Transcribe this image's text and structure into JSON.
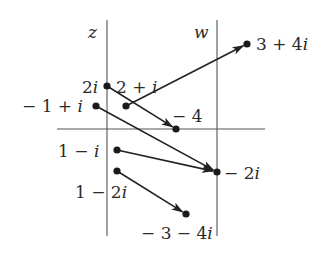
{
  "figure": {
    "axes": {
      "z_label": "z",
      "w_label": "w",
      "z_axis_x": 107,
      "w_axis_x": 217,
      "real_axis_y": 129,
      "real_axis_x1": 57,
      "real_axis_x2": 265,
      "vertical_top": 20,
      "vertical_bottom": 236
    },
    "colors": {
      "axis": "#555555",
      "arrow": "#222222",
      "point": "#1a1a1a",
      "text": "#2a2a2a"
    },
    "points": [
      {
        "id": "z-2i",
        "label": "2i",
        "x": 107,
        "y": 86,
        "lx": 82,
        "ly": 93,
        "anchor": "start"
      },
      {
        "id": "z-2+i",
        "label": "2 + i",
        "x": 126,
        "y": 106,
        "lx": 116,
        "ly": 93,
        "anchor": "start"
      },
      {
        "id": "z--1+i",
        "label": "− 1 + i",
        "x": 96,
        "y": 106,
        "lx": 22,
        "ly": 112,
        "anchor": "start"
      },
      {
        "id": "z-1-i",
        "label": "1 − i",
        "x": 117,
        "y": 150,
        "lx": 58,
        "ly": 157,
        "anchor": "start"
      },
      {
        "id": "z-1-2i",
        "label": "1 − 2i",
        "x": 117,
        "y": 171,
        "lx": 75,
        "ly": 198,
        "anchor": "start"
      },
      {
        "id": "w-3+4i",
        "label": "3 + 4i",
        "x": 247,
        "y": 44,
        "lx": 256,
        "ly": 50,
        "anchor": "start"
      },
      {
        "id": "w--4",
        "label": "− 4",
        "x": 176,
        "y": 129,
        "lx": 172,
        "ly": 122,
        "anchor": "start"
      },
      {
        "id": "w--2i",
        "label": "− 2i",
        "x": 217,
        "y": 172,
        "lx": 224,
        "ly": 179,
        "anchor": "start"
      },
      {
        "id": "w--3-4i",
        "label": "− 3 − 4i",
        "x": 186,
        "y": 214,
        "lx": 141,
        "ly": 239,
        "anchor": "start"
      }
    ],
    "mappings": [
      {
        "from": "2 + i",
        "to": "3 + 4i",
        "x1": 126,
        "y1": 106,
        "x2": 247,
        "y2": 44
      },
      {
        "from": "2i",
        "to": "− 4",
        "x1": 107,
        "y1": 86,
        "x2": 176,
        "y2": 129
      },
      {
        "from": "− 1 + i",
        "to": "− 2i",
        "x1": 96,
        "y1": 106,
        "x2": 217,
        "y2": 172
      },
      {
        "from": "1 − i",
        "to": "− 2i",
        "x1": 117,
        "y1": 150,
        "x2": 217,
        "y2": 172
      },
      {
        "from": "1 − 2i",
        "to": "− 3 − 4i",
        "x1": 117,
        "y1": 171,
        "x2": 186,
        "y2": 214
      }
    ]
  }
}
